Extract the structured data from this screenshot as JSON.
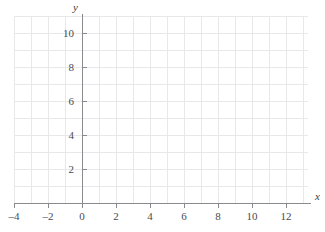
{
  "figure": {
    "kind": "empty-cartesian-grid",
    "width": 325,
    "height": 232,
    "background_color": "#ffffff",
    "grid_color": "#e8e8ea",
    "axis_color": "#8a8a8e",
    "label_color": "#4a4a4e"
  },
  "axis_labels": {
    "x_name": "x",
    "y_name": "y"
  },
  "chart_data": {
    "type": "scatter",
    "title": "",
    "subtitle": "",
    "xlabel": "x",
    "ylabel": "y",
    "series": [],
    "annotations": [],
    "legend": null,
    "legend_position": "none",
    "grid": true,
    "grid_step_x": 1,
    "grid_step_y": 1,
    "xlim": [
      -4.3,
      13.3
    ],
    "ylim": [
      -0.5,
      11.6
    ],
    "x_tick_values": [
      -4,
      -2,
      0,
      2,
      4,
      6,
      8,
      10,
      12
    ],
    "y_tick_values": [
      2,
      4,
      6,
      8,
      10
    ],
    "x_tick_labels": [
      "–4",
      "–2",
      "0",
      "2",
      "4",
      "6",
      "8",
      "10",
      "12"
    ],
    "y_tick_labels": [
      "2",
      "4",
      "6",
      "8",
      "10"
    ],
    "x_minor_gridlines": [
      -4,
      -3,
      -2,
      -1,
      0,
      1,
      2,
      3,
      4,
      5,
      6,
      7,
      8,
      9,
      10,
      11,
      12,
      13
    ],
    "y_minor_gridlines": [
      0,
      1,
      2,
      3,
      4,
      5,
      6,
      7,
      8,
      9,
      10,
      11
    ],
    "values": [],
    "categories": []
  },
  "geometry": {
    "origin_x_px": 82,
    "origin_y_px": 203,
    "unit_px": 17,
    "grid_left_px": 14,
    "grid_right_px": 308,
    "grid_top_px": 16,
    "grid_bottom_px": 203,
    "axis_x_end_px": 311,
    "axis_y_top_px": 14
  }
}
